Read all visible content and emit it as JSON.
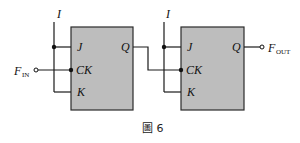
{
  "figure": {
    "caption": "圖 6",
    "box_fill": "#bdbdbd",
    "wire_color": "#1a1a1a"
  },
  "input": {
    "label_main": "F",
    "label_sub": "IN"
  },
  "output": {
    "label_main": "F",
    "label_sub": "OUT"
  },
  "flip_flops": [
    {
      "id": "ff1",
      "supply_label": "I",
      "pins": {
        "j": "J",
        "ck": "CK",
        "k": "K",
        "q": "Q"
      }
    },
    {
      "id": "ff2",
      "supply_label": "I",
      "pins": {
        "j": "J",
        "ck": "CK",
        "k": "K",
        "q": "Q"
      }
    }
  ]
}
